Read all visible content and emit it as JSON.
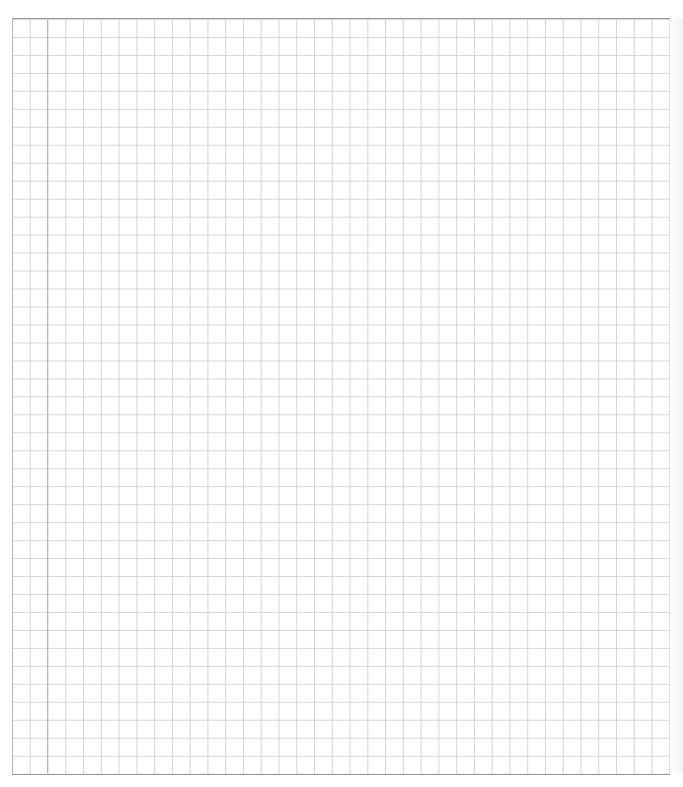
{
  "page": {
    "type": "graph-paper",
    "grid": {
      "columns": 37,
      "rows": 42,
      "cell_width_px": 17.8,
      "cell_height_px": 18,
      "line_color": "#d4d4d4",
      "border_color": "#9a9a9a",
      "margin_line_color": "#b8b8b8"
    },
    "content": ""
  }
}
